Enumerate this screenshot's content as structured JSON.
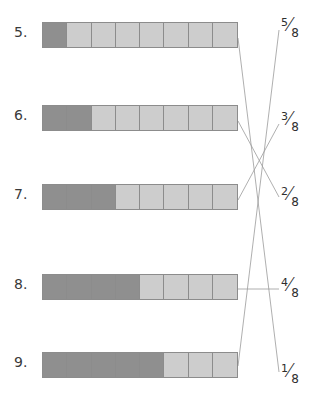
{
  "worksheet": {
    "total_parts": 8,
    "rows": [
      {
        "number": "5.",
        "shaded": 1,
        "total": 8,
        "top": 22
      },
      {
        "number": "6.",
        "shaded": 2,
        "total": 8,
        "top": 105
      },
      {
        "number": "7.",
        "shaded": 3,
        "total": 8,
        "top": 184
      },
      {
        "number": "8.",
        "shaded": 4,
        "total": 8,
        "top": 274
      },
      {
        "number": "9.",
        "shaded": 5,
        "total": 8,
        "top": 352
      }
    ],
    "fractions": [
      {
        "numerator": "5",
        "denominator": "8",
        "label": "5/8",
        "left": 281,
        "top": 14
      },
      {
        "numerator": "3",
        "denominator": "8",
        "label": "3/8",
        "left": 281,
        "top": 108
      },
      {
        "numerator": "2",
        "denominator": "8",
        "label": "2/8",
        "left": 281,
        "top": 183
      },
      {
        "numerator": "4",
        "denominator": "8",
        "label": "4/8",
        "left": 281,
        "top": 274
      },
      {
        "numerator": "1",
        "denominator": "8",
        "label": "1/8",
        "left": 281,
        "top": 360
      }
    ],
    "connectors": [
      {
        "from_row": "5.",
        "to_fraction": "1/8",
        "x1": 238,
        "y1": 38,
        "x2": 279,
        "y2": 372
      },
      {
        "from_row": "6.",
        "to_fraction": "2/8",
        "x1": 238,
        "y1": 121,
        "x2": 279,
        "y2": 197
      },
      {
        "from_row": "7.",
        "to_fraction": "3/8",
        "x1": 238,
        "y1": 200,
        "x2": 279,
        "y2": 124
      },
      {
        "from_row": "8.",
        "to_fraction": "4/8",
        "x1": 238,
        "y1": 289,
        "x2": 279,
        "y2": 289
      },
      {
        "from_row": "9.",
        "to_fraction": "5/8",
        "x1": 238,
        "y1": 366,
        "x2": 279,
        "y2": 30
      }
    ],
    "colors": {
      "shaded": "#8f8f8f",
      "unshaded": "#cdcdcd",
      "border": "#8c8c8c",
      "line": "#9a9a9a",
      "text": "#2e2e2e"
    }
  }
}
